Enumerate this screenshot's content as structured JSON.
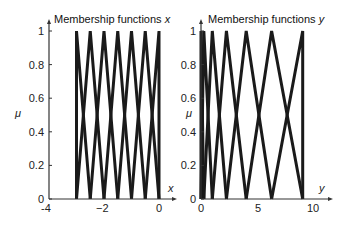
{
  "chart_data": [
    {
      "type": "line",
      "title": "Membership functions x",
      "title_prefix": "Membership functions ",
      "title_var": "x",
      "xlabel": "x",
      "ylabel": "μ",
      "xlim": [
        -4,
        0
      ],
      "ylim": [
        0,
        1
      ],
      "xticks": [
        "-4",
        "−2",
        "0"
      ],
      "yticks": [
        "0",
        "0.2",
        "0.4",
        "0.6",
        "0.8",
        "1"
      ],
      "grid": false,
      "shape": "triangular",
      "centers": [
        -3,
        -2.5,
        -2,
        -1.5,
        -1,
        -0.5,
        0
      ],
      "series": [
        {
          "name": "MF1",
          "x": [
            -3,
            -3,
            -2.5
          ],
          "y": [
            0,
            1,
            0
          ]
        },
        {
          "name": "MF2",
          "x": [
            -3,
            -2.5,
            -2
          ],
          "y": [
            0,
            1,
            0
          ]
        },
        {
          "name": "MF3",
          "x": [
            -2.5,
            -2,
            -1.5
          ],
          "y": [
            0,
            1,
            0
          ]
        },
        {
          "name": "MF4",
          "x": [
            -2,
            -1.5,
            -1
          ],
          "y": [
            0,
            1,
            0
          ]
        },
        {
          "name": "MF5",
          "x": [
            -1.5,
            -1,
            -0.5
          ],
          "y": [
            0,
            1,
            0
          ]
        },
        {
          "name": "MF6",
          "x": [
            -1,
            -0.5,
            0
          ],
          "y": [
            0,
            1,
            0
          ]
        },
        {
          "name": "MF7",
          "x": [
            -0.5,
            0,
            0
          ],
          "y": [
            0,
            1,
            0
          ]
        }
      ]
    },
    {
      "type": "line",
      "title": "Membership functions y",
      "title_prefix": "Membership functions ",
      "title_var": "y",
      "xlabel": "y",
      "ylabel": "μ",
      "xlim": [
        0,
        10
      ],
      "ylim": [
        0,
        1
      ],
      "xticks": [
        "0",
        "5",
        "10"
      ],
      "yticks": [
        "0",
        "0.2",
        "0.4",
        "0.6",
        "0.8",
        "1"
      ],
      "grid": false,
      "shape": "triangular",
      "centers": [
        0,
        0.25,
        1,
        2.25,
        4,
        6.25,
        9
      ],
      "series": [
        {
          "name": "MF1",
          "x": [
            0,
            0,
            0.25
          ],
          "y": [
            0,
            1,
            0
          ]
        },
        {
          "name": "MF2",
          "x": [
            0,
            0.25,
            1
          ],
          "y": [
            0,
            1,
            0
          ]
        },
        {
          "name": "MF3",
          "x": [
            0.25,
            1,
            2.25
          ],
          "y": [
            0,
            1,
            0
          ]
        },
        {
          "name": "MF4",
          "x": [
            1,
            2.25,
            4
          ],
          "y": [
            0,
            1,
            0
          ]
        },
        {
          "name": "MF5",
          "x": [
            2.25,
            4,
            6.25
          ],
          "y": [
            0,
            1,
            0
          ]
        },
        {
          "name": "MF6",
          "x": [
            4,
            6.25,
            9
          ],
          "y": [
            0,
            1,
            0
          ]
        },
        {
          "name": "MF7",
          "x": [
            6.25,
            9,
            9
          ],
          "y": [
            0,
            1,
            0
          ]
        }
      ]
    }
  ],
  "colors": {
    "line": "#1a1a1a",
    "axis": "#333333",
    "text": "#222222"
  }
}
